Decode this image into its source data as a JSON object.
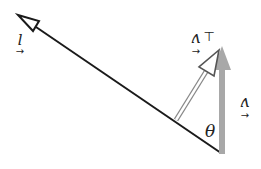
{
  "diagram": {
    "orientation": "rotated-180",
    "colors": {
      "line": "#1a1a1a",
      "gray_arrow": "#a8a8a8",
      "background": "#ffffff"
    },
    "vectors": [
      {
        "id": "l",
        "label": "l",
        "description": "long vector with open arrowhead"
      },
      {
        "id": "v_perp",
        "label": "v",
        "subscript_mark": "⊥",
        "description": "perpendicular component, double-line open arrow"
      },
      {
        "id": "v",
        "label": "v",
        "description": "gray vertical vector"
      }
    ],
    "angle": {
      "label": "θ"
    },
    "labels": {
      "l": "l",
      "v_perp": "v",
      "perp_mark": "⊥",
      "v": "v",
      "theta": "θ",
      "vec_arrow": "←"
    }
  }
}
